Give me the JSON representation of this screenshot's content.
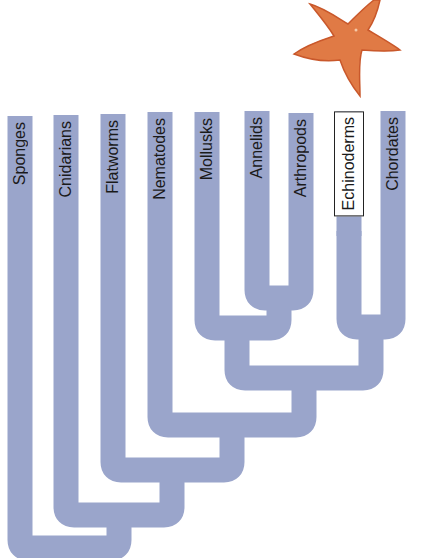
{
  "diagram": {
    "type": "cladogram",
    "orientation": "root-bottom-left, tips-top",
    "colors": {
      "branch": "#9aa5cb",
      "text": "#1a1a1a",
      "starfish": "#e07a45",
      "starfish_dark": "#c9582b"
    },
    "taxa": [
      {
        "label": "Sponges",
        "x": 20,
        "top": 116,
        "highlighted": false
      },
      {
        "label": "Cnidarians",
        "x": 66,
        "top": 115,
        "highlighted": false
      },
      {
        "label": "Flatworms",
        "x": 113,
        "top": 114,
        "highlighted": false
      },
      {
        "label": "Nematodes",
        "x": 160,
        "top": 112,
        "highlighted": false
      },
      {
        "label": "Mollusks",
        "x": 207,
        "top": 112,
        "highlighted": false
      },
      {
        "label": "Annelids",
        "x": 257,
        "top": 111,
        "highlighted": false
      },
      {
        "label": "Arthropods",
        "x": 301,
        "top": 113,
        "highlighted": false
      },
      {
        "label": "Echinoderms",
        "x": 349,
        "top": 111,
        "highlighted": true
      },
      {
        "label": "Chordates",
        "x": 393,
        "top": 111,
        "highlighted": false
      }
    ],
    "clades": [
      {
        "name": "annelids-arthropods",
        "members": [
          "Annelids",
          "Arthropods"
        ]
      },
      {
        "name": "protostomes-spiralia",
        "members": [
          "Mollusks",
          "Annelids",
          "Arthropods"
        ]
      },
      {
        "name": "deuterostomes",
        "members": [
          "Echinoderms",
          "Chordates"
        ]
      },
      {
        "name": "bilateria-core",
        "members": [
          "Mollusks",
          "Annelids",
          "Arthropods",
          "Echinoderms",
          "Chordates"
        ]
      },
      {
        "name": "with-nematodes",
        "members": [
          "Nematodes",
          "Mollusks",
          "Annelids",
          "Arthropods",
          "Echinoderms",
          "Chordates"
        ]
      },
      {
        "name": "bilateria",
        "members": [
          "Flatworms",
          "Nematodes",
          "Mollusks",
          "Annelids",
          "Arthropods",
          "Echinoderms",
          "Chordates"
        ]
      },
      {
        "name": "eumetazoa",
        "members": [
          "Cnidarians",
          "Flatworms",
          "Nematodes",
          "Mollusks",
          "Annelids",
          "Arthropods",
          "Echinoderms",
          "Chordates"
        ]
      },
      {
        "name": "animals",
        "members": [
          "Sponges",
          "Cnidarians",
          "Flatworms",
          "Nematodes",
          "Mollusks",
          "Annelids",
          "Arthropods",
          "Echinoderms",
          "Chordates"
        ]
      }
    ],
    "illustration": {
      "subject": "starfish",
      "position": "top-right above Echinoderms"
    }
  }
}
